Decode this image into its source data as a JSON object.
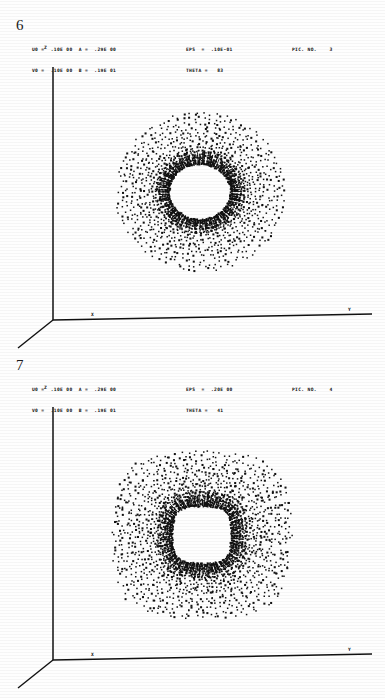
{
  "document": {
    "background_color": "#ffffff",
    "ink_color": "#111111",
    "width": 385,
    "height": 698
  },
  "panels": [
    {
      "figure_number": "6",
      "header": {
        "left_lines": [
          "U0 =  .10E 00  A =  .29E 00",
          "V0 =  .10E 00  B =  .19E 01"
        ],
        "mid_lines": [
          "EPS  =  .10E-01",
          "THETA =   83"
        ],
        "right_lines": [
          "PIC. NO.    3"
        ]
      },
      "axes": {
        "z_label": "Z",
        "x_label": "X",
        "y_label": "Y"
      },
      "plot": {
        "type": "scatter",
        "shape": "annulus",
        "center_x": 200,
        "center_y": 180,
        "outer_radius_x": 83,
        "outer_radius_y": 78,
        "inner_radius_x": 31,
        "inner_radius_y": 28,
        "squareness": 0.0,
        "spokes": 96,
        "rings": 15,
        "dot_size": 1.5,
        "jitter": 2.6,
        "rim_bias": 0.35,
        "seed": 1607
      }
    },
    {
      "figure_number": "7",
      "header": {
        "left_lines": [
          "U0 =  .10E 00  A =  .29E 00",
          "V0 =  .10E 00  B =  .19E 01"
        ],
        "mid_lines": [
          "EPS  =  .20E 00",
          "THETA =   41"
        ],
        "right_lines": [
          "PIC. NO.    4"
        ]
      },
      "axes": {
        "z_label": "Z",
        "x_label": "X",
        "y_label": "Y"
      },
      "plot": {
        "type": "scatter",
        "shape": "rounded-square-annulus",
        "center_x": 202,
        "center_y": 183,
        "outer_radius_x": 88,
        "outer_radius_y": 82,
        "inner_radius_x": 30,
        "inner_radius_y": 29,
        "squareness": 0.62,
        "spokes": 104,
        "rings": 17,
        "dot_size": 1.5,
        "jitter": 3.0,
        "rim_bias": 0.2,
        "seed": 90210
      }
    }
  ],
  "chart_data": {
    "type": "scatter",
    "title": "",
    "xlabel": "X",
    "ylabel": "Y",
    "zlabel": "Z",
    "grid": false,
    "legend": "none",
    "figures": [
      {
        "figure_number": "6",
        "pic_no": "3",
        "parameters": {
          "U0": ".10E 00",
          "V0": ".10E 00",
          "A": ".29E 00",
          "B": ".19E 01",
          "EPS": ".10E-01",
          "THETA": "83"
        },
        "description": "Dense dot cloud forming a circular annulus (torus projection) with radial spoke striations and an empty elliptical core.",
        "point_count_estimate": 1440
      },
      {
        "figure_number": "7",
        "pic_no": "4",
        "parameters": {
          "U0": ".10E 00",
          "V0": ".10E 00",
          "A": ".29E 00",
          "B": ".19E 01",
          "EPS": ".20E 00",
          "THETA": "41"
        },
        "description": "Dense dot cloud forming a rounded-square annulus with heavier inner rim and a rounded-square empty core.",
        "point_count_estimate": 1768
      }
    ]
  }
}
